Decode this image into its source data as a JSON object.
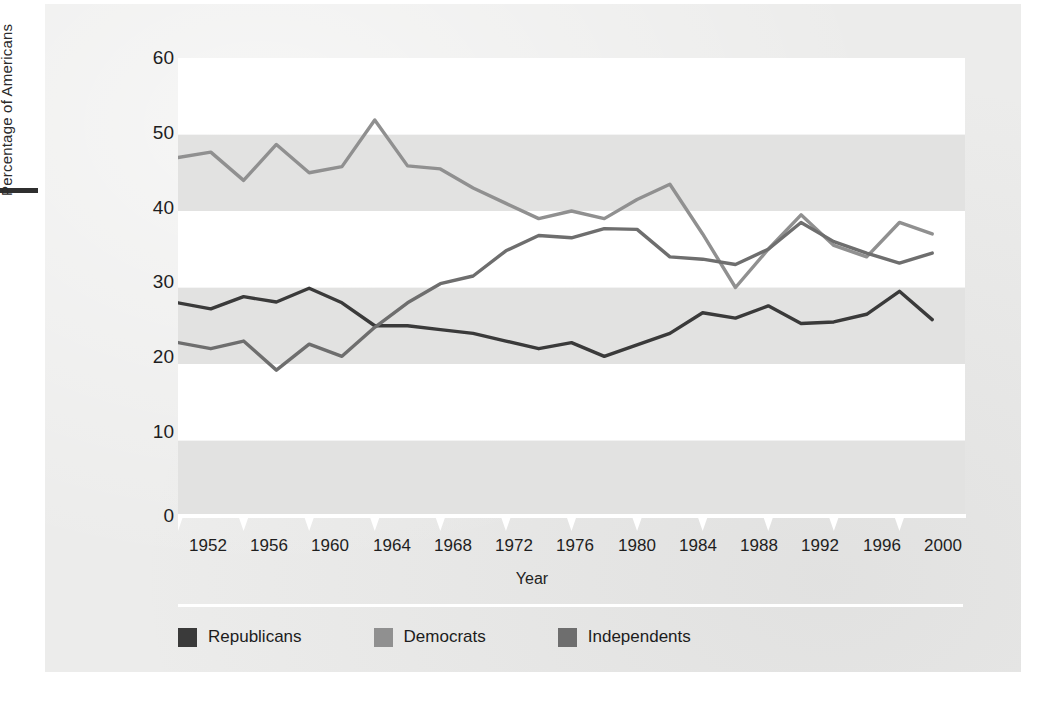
{
  "figure": {
    "background_color": "#ececeb",
    "band_white": "#ffffff",
    "band_gray": "#e2e2e1"
  },
  "axes": {
    "y_title": "Percentage of Americans",
    "x_title": "Year",
    "y_ticks": [
      "60",
      "50",
      "40",
      "30",
      "20",
      "10",
      "0"
    ],
    "x_ticks": [
      "1952",
      "1956",
      "1960",
      "1964",
      "1968",
      "1972",
      "1976",
      "1980",
      "1984",
      "1988",
      "1992",
      "1996",
      "2000"
    ]
  },
  "legend": {
    "items": [
      {
        "label": "Republicans",
        "color": "#3a3a3a"
      },
      {
        "label": "Democrats",
        "color": "#909090"
      },
      {
        "label": "Independents",
        "color": "#6e6e6e"
      }
    ]
  },
  "chart_data": {
    "type": "line",
    "title": "",
    "xlabel": "Year",
    "ylabel": "Percentage of Americans",
    "xlim": [
      1952,
      2000
    ],
    "ylim": [
      0,
      60
    ],
    "ytick_interval": 10,
    "xtick_interval": 4,
    "grid": "alternating horizontal bands",
    "legend_position": "below-plot",
    "x": [
      1952,
      1954,
      1956,
      1958,
      1960,
      1962,
      1964,
      1966,
      1968,
      1970,
      1972,
      1974,
      1976,
      1978,
      1980,
      1982,
      1984,
      1986,
      1988,
      1990,
      1992,
      1994,
      1996,
      1998
    ],
    "series": [
      {
        "name": "Republicans",
        "color": "#3a3a3a",
        "values": [
          28.0,
          27.2,
          28.8,
          28.1,
          29.9,
          28.0,
          25.0,
          25.0,
          24.5,
          24.0,
          23.0,
          22.0,
          22.8,
          21.0,
          22.5,
          24.0,
          26.7,
          26.0,
          27.6,
          25.3,
          25.5,
          26.5,
          29.5,
          25.8
        ]
      },
      {
        "name": "Democrats",
        "color": "#909090",
        "values": [
          47.0,
          47.7,
          44.0,
          48.7,
          45.0,
          45.8,
          51.9,
          45.9,
          45.5,
          43.0,
          41.0,
          39.0,
          40.0,
          39.0,
          41.5,
          43.5,
          37.0,
          30.0,
          35.0,
          39.5,
          35.5,
          34.0,
          38.5,
          37.0
        ]
      },
      {
        "name": "Independents",
        "color": "#6e6e6e",
        "values": [
          22.8,
          22.0,
          23.0,
          19.2,
          22.6,
          21.0,
          24.8,
          28.0,
          30.5,
          31.5,
          34.8,
          36.8,
          36.5,
          37.7,
          37.6,
          34.0,
          33.7,
          33.0,
          35.0,
          38.5,
          36.0,
          34.5,
          33.2,
          34.5
        ]
      }
    ]
  }
}
